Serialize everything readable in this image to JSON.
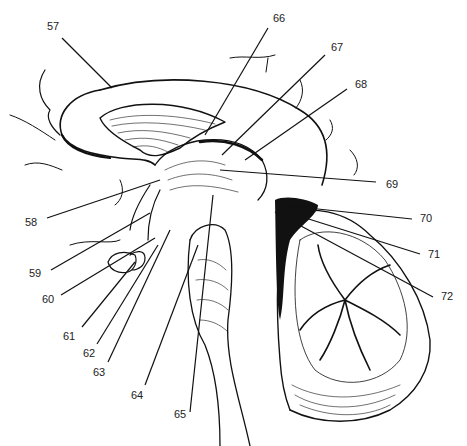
{
  "figure": {
    "type": "anatomical line drawing",
    "labels": [
      {
        "id": "57",
        "text": "57",
        "x": 47,
        "y": 30,
        "line": [
          62,
          38,
          112,
          88
        ]
      },
      {
        "id": "58",
        "text": "58",
        "x": 25,
        "y": 226,
        "line": [
          47,
          218,
          160,
          180
        ]
      },
      {
        "id": "59",
        "text": "59",
        "x": 29,
        "y": 277,
        "line": [
          51,
          270,
          150,
          213
        ]
      },
      {
        "id": "60",
        "text": "60",
        "x": 42,
        "y": 303,
        "line": [
          61,
          295,
          155,
          238
        ]
      },
      {
        "id": "61",
        "text": "61",
        "x": 63,
        "y": 340,
        "line": [
          82,
          327,
          135,
          262
        ]
      },
      {
        "id": "62",
        "text": "62",
        "x": 83,
        "y": 357,
        "line": [
          97,
          344,
          158,
          245
        ]
      },
      {
        "id": "63",
        "text": "63",
        "x": 93,
        "y": 376,
        "line": [
          108,
          362,
          170,
          230
        ]
      },
      {
        "id": "64",
        "text": "64",
        "x": 131,
        "y": 399,
        "line": [
          145,
          385,
          198,
          245
        ]
      },
      {
        "id": "65",
        "text": "65",
        "x": 174,
        "y": 418,
        "line": [
          190,
          412,
          213,
          195
        ]
      },
      {
        "id": "66",
        "text": "66",
        "x": 273,
        "y": 22,
        "line": [
          268,
          28,
          205,
          135
        ]
      },
      {
        "id": "67",
        "text": "67",
        "x": 331,
        "y": 51,
        "line": [
          325,
          55,
          222,
          155
        ]
      },
      {
        "id": "68",
        "text": "68",
        "x": 355,
        "y": 88,
        "line": [
          347,
          89,
          245,
          160
        ]
      },
      {
        "id": "69",
        "text": "69",
        "x": 386,
        "y": 188,
        "line": [
          376,
          182,
          220,
          170
        ]
      },
      {
        "id": "70",
        "text": "70",
        "x": 420,
        "y": 222,
        "line": [
          412,
          219,
          280,
          205
        ]
      },
      {
        "id": "71",
        "text": "71",
        "x": 428,
        "y": 258,
        "line": [
          420,
          254,
          280,
          210
        ]
      },
      {
        "id": "72",
        "text": "72",
        "x": 441,
        "y": 300,
        "line": [
          433,
          297,
          275,
          212
        ]
      }
    ]
  }
}
